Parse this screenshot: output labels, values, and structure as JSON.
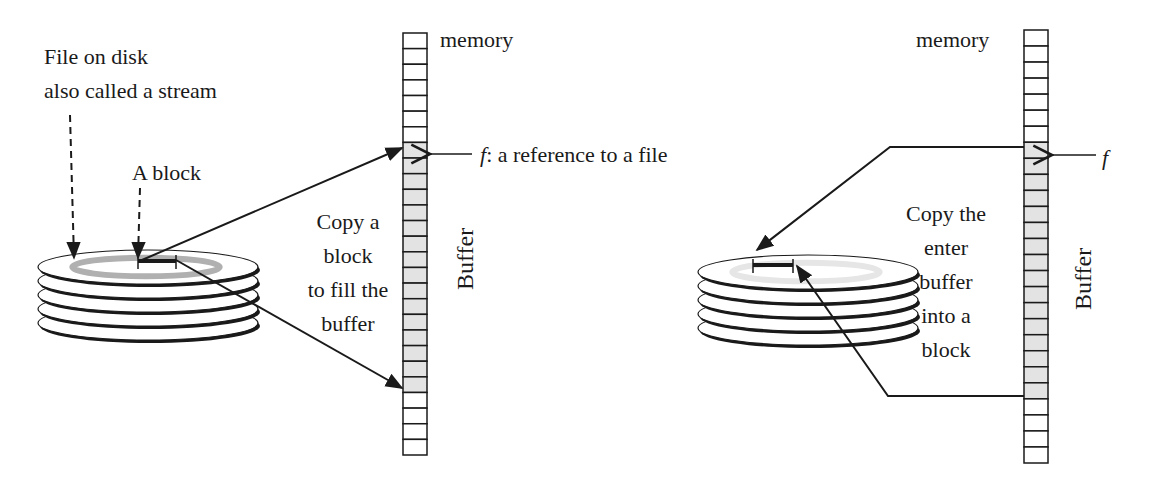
{
  "left_panel": {
    "file_label_line1": "File on disk",
    "file_label_line2": "also called a stream",
    "block_label": "A block",
    "memory_label": "memory",
    "ref_label_f": "f",
    "ref_label_rest": ": a reference to a file",
    "copy_text": [
      "Copy a",
      "block",
      "to fill the",
      "buffer"
    ],
    "buffer_label": "Buffer",
    "memory_cells": {
      "top_empty": 7,
      "buffer": 16,
      "bottom_empty": 4
    }
  },
  "right_panel": {
    "memory_label": "memory",
    "ref_label_f": "f",
    "copy_text": [
      "Copy the",
      "enter",
      "buffer",
      "into a",
      "block"
    ],
    "buffer_label": "Buffer",
    "memory_cells": {
      "top_empty": 7,
      "buffer": 16,
      "bottom_empty": 4
    }
  },
  "colors": {
    "line": "#1a1a1a",
    "buffer_fill": "#e3e3e3",
    "track_fill": "#b0b0b0",
    "track_light": "#e6e6e6"
  }
}
